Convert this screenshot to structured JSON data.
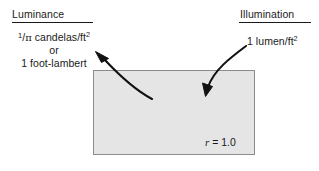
{
  "figure": {
    "width": 319,
    "height": 171,
    "background": "#ffffff",
    "ink_color": "#1a1a1a"
  },
  "headings": {
    "luminance": "Luminance",
    "illumination": "Illumination"
  },
  "labels": {
    "luminance_value": {
      "line1_numerator": "1",
      "line1_slash": "/",
      "line1_pi": "π",
      "line1_rest": " candelas/ft",
      "line1_exponent": "2",
      "line2": "or",
      "line3": "1 foot-lambert",
      "plain_text": "1/π candelas/ft² or 1 foot-lambert"
    },
    "illumination_value": {
      "text": "1 lumen/ft",
      "exponent": "2",
      "plain_text": "1 lumen/ft²"
    },
    "reflectance": {
      "symbol": "r",
      "equals": " = ",
      "value": "1.0",
      "plain_text": "r = 1.0"
    }
  },
  "surface": {
    "name": "diffuse-reflecting-surface",
    "fill_color": "#e5e5e5",
    "border_color": "#8c8c8c",
    "x": 93,
    "y": 70,
    "width": 162,
    "height": 85
  },
  "arrows": [
    {
      "name": "luminance-arrow",
      "description": "curved arrow from surface interior up-left to luminance label",
      "from_x": 152,
      "from_y": 99,
      "to_x": 96,
      "to_y": 52,
      "color": "#111111"
    },
    {
      "name": "illumination-arrow",
      "description": "curved arrow from illumination label down-left into surface",
      "from_x": 246,
      "from_y": 46,
      "to_x": 205,
      "to_y": 96,
      "color": "#111111"
    }
  ]
}
